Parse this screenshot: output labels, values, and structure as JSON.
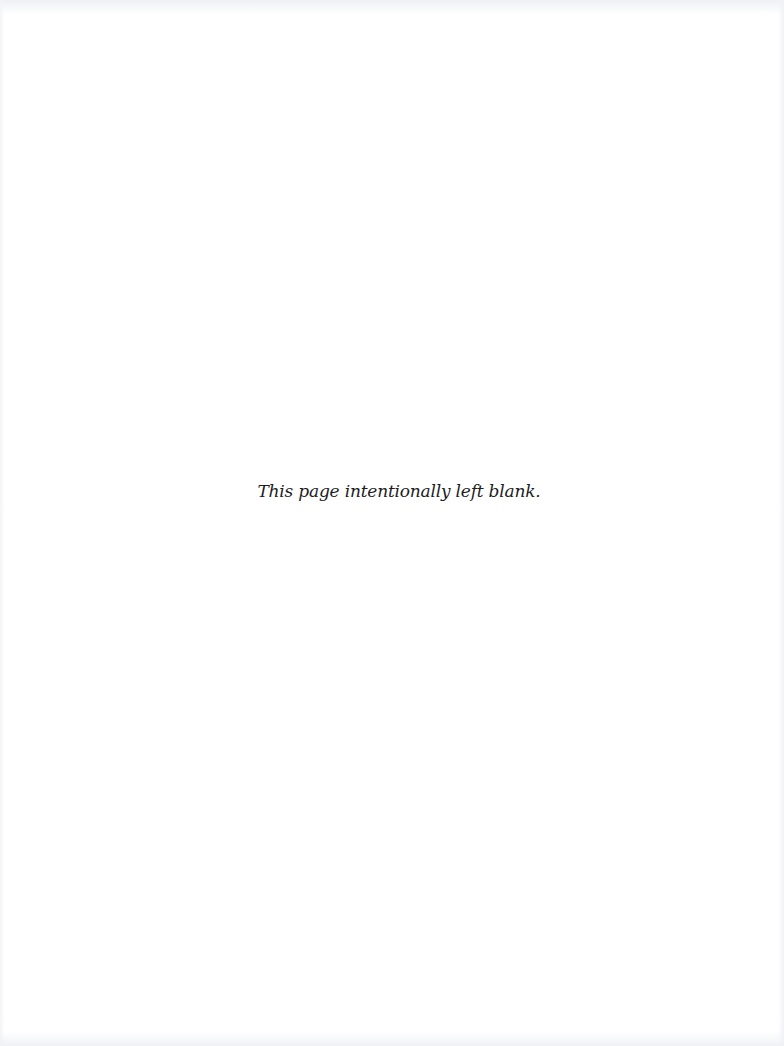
{
  "page": {
    "background_color": "#ffffff",
    "text_color": "#1d1d1d",
    "message": "This page intentionally left blank."
  }
}
